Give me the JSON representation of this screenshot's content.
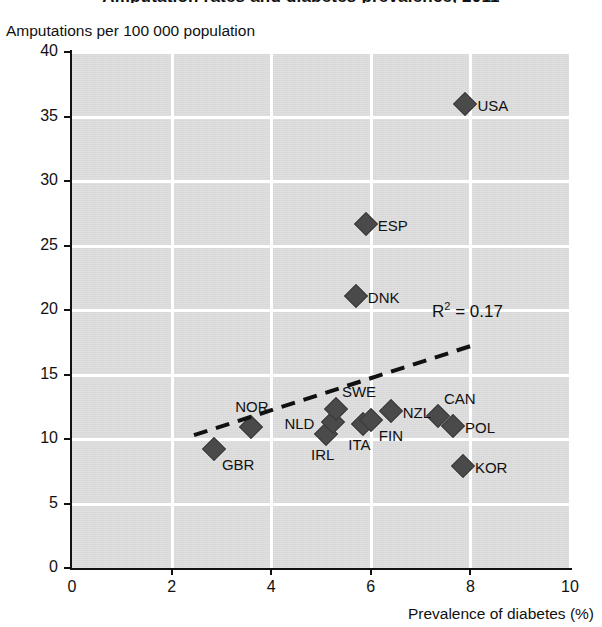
{
  "chart_data": {
    "type": "scatter",
    "title": "Amputation rates and diabetes prevalence, 2011",
    "ylabel": "Amputations per 100 000 population",
    "xlabel": "Prevalence of diabetes (%)",
    "xlim": [
      0,
      10
    ],
    "ylim": [
      0,
      40
    ],
    "xticks": [
      "0",
      "2",
      "4",
      "6",
      "8",
      "10"
    ],
    "yticks": [
      "0",
      "5",
      "10",
      "15",
      "20",
      "25",
      "30",
      "35",
      "40"
    ],
    "grid": true,
    "legend": "none",
    "annotations": [
      {
        "id": "r-squared",
        "text_prefix": "R",
        "text_sup": "2",
        "text_suffix": " = 0.17",
        "full": "R2 = 0.17"
      }
    ],
    "trendline": {
      "style": "dashed",
      "x_start": 2.45,
      "y_start": 10.3,
      "x_end": 8.0,
      "y_end": 17.2
    },
    "points": [
      {
        "label": "GBR",
        "x": 2.85,
        "y": 9.2,
        "label_pos": "below-right"
      },
      {
        "label": "NOR",
        "x": 3.6,
        "y": 10.9,
        "label_pos": "above"
      },
      {
        "label": "IRL",
        "x": 5.1,
        "y": 10.4,
        "label_pos": "below"
      },
      {
        "label": "NLD",
        "x": 5.25,
        "y": 11.3,
        "label_pos": "left"
      },
      {
        "label": "SWE",
        "x": 5.3,
        "y": 12.3,
        "label_pos": "above-right"
      },
      {
        "label": "DNK",
        "x": 5.7,
        "y": 21.1,
        "label_pos": "right"
      },
      {
        "label": "ITA",
        "x": 5.85,
        "y": 11.2,
        "label_pos": "below"
      },
      {
        "label": "ESP",
        "x": 5.9,
        "y": 26.7,
        "label_pos": "right"
      },
      {
        "label": "FIN",
        "x": 6.0,
        "y": 11.5,
        "label_pos": "below-right"
      },
      {
        "label": "NZL",
        "x": 6.4,
        "y": 12.2,
        "label_pos": "right"
      },
      {
        "label": "CAN",
        "x": 7.35,
        "y": 11.8,
        "label_pos": "above-right"
      },
      {
        "label": "POL",
        "x": 7.65,
        "y": 11.0,
        "label_pos": "right"
      },
      {
        "label": "KOR",
        "x": 7.85,
        "y": 7.9,
        "label_pos": "right"
      },
      {
        "label": "USA",
        "x": 7.9,
        "y": 36.0,
        "label_pos": "right"
      }
    ]
  },
  "colors": {
    "marker": "#4a4a4a",
    "plot_background": "#dcdcdc",
    "grid": "#ffffff",
    "axis": "#111111",
    "text": "#111111"
  }
}
